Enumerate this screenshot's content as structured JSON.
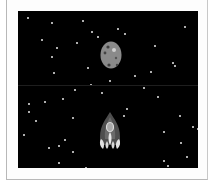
{
  "game": {
    "canvas": {
      "background": "#000000",
      "width": 180,
      "height": 157
    },
    "asteroid": {
      "color": "#8a8a8a",
      "crater_color": "#444444",
      "highlight": "#d0d0d0",
      "x": 82,
      "y": 30
    },
    "ship": {
      "body_color": "#555555",
      "window_color": "#aaaaaa",
      "flame_color": "#e0e0e0",
      "x": 80,
      "y": 100
    },
    "stars": [
      [
        9,
        6
      ],
      [
        33,
        11
      ],
      [
        64,
        9
      ],
      [
        73,
        20
      ],
      [
        79,
        25
      ],
      [
        99,
        17
      ],
      [
        106,
        22
      ],
      [
        23,
        28
      ],
      [
        58,
        31
      ],
      [
        38,
        36
      ],
      [
        33,
        45
      ],
      [
        136,
        34
      ],
      [
        166,
        15
      ],
      [
        154,
        51
      ],
      [
        156,
        54
      ],
      [
        35,
        61
      ],
      [
        69,
        56
      ],
      [
        116,
        64
      ],
      [
        132,
        60
      ],
      [
        91,
        69
      ],
      [
        72,
        73
      ],
      [
        56,
        78
      ],
      [
        83,
        81
      ],
      [
        125,
        76
      ],
      [
        139,
        85
      ],
      [
        26,
        90
      ],
      [
        44,
        87
      ],
      [
        10,
        92
      ],
      [
        10,
        100
      ],
      [
        17,
        109
      ],
      [
        54,
        106
      ],
      [
        108,
        97
      ],
      [
        105,
        104
      ],
      [
        161,
        104
      ],
      [
        174,
        115
      ],
      [
        179,
        117
      ],
      [
        5,
        123
      ],
      [
        145,
        120
      ],
      [
        46,
        128
      ],
      [
        30,
        136
      ],
      [
        40,
        134
      ],
      [
        54,
        140
      ],
      [
        162,
        131
      ],
      [
        168,
        145
      ],
      [
        40,
        151
      ],
      [
        67,
        156
      ],
      [
        145,
        149
      ],
      [
        149,
        154
      ]
    ]
  }
}
